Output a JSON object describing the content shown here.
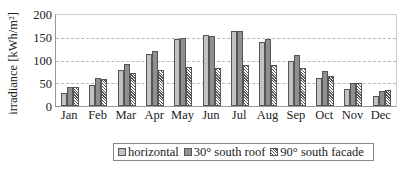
{
  "chart_data": {
    "type": "bar",
    "title": "",
    "xlabel": "",
    "ylabel": "irradiance [kWh/m²]",
    "ylim": [
      0,
      200
    ],
    "yticks": [
      "0",
      "50",
      "100",
      "150",
      "200"
    ],
    "grid": "horizontal dashed",
    "legend_position": "bottom",
    "categories": [
      "Jan",
      "Feb",
      "Mar",
      "Apr",
      "May",
      "Jun",
      "Jul",
      "Aug",
      "Sep",
      "Oct",
      "Nov",
      "Dec"
    ],
    "series": [
      {
        "name": "horizontal",
        "color": "#c4c4c4",
        "values": [
          28,
          47,
          80,
          115,
          148,
          155,
          165,
          141,
          100,
          61,
          37,
          23
        ]
      },
      {
        "name": "30° south roof",
        "color": "#8f8f8f",
        "values": [
          41,
          61,
          92,
          122,
          149,
          153,
          165,
          148,
          113,
          76,
          51,
          34
        ]
      },
      {
        "name": "90° south facade",
        "color": "hatched",
        "values": [
          42,
          59,
          72,
          80,
          85,
          84,
          91,
          91,
          84,
          65,
          51,
          36
        ]
      }
    ]
  }
}
